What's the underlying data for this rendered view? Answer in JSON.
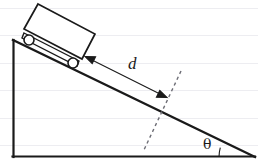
{
  "figure": {
    "kind": "inclined-plane-physics-diagram",
    "background_color": "#ffffff",
    "stroke_color": "#1a1a1a",
    "gridline_color": "#ededf1",
    "width": 258,
    "height": 165
  },
  "labels": {
    "distance": "d",
    "angle": "θ"
  },
  "incline": {
    "apex_top": [
      13,
      40
    ],
    "apex_bottom_left": [
      13,
      157
    ],
    "apex_right": [
      255,
      157
    ],
    "gridlines_y": [
      8,
      35,
      63,
      90,
      118,
      145
    ]
  },
  "cart": {
    "body_corners": [
      [
        38,
        4
      ],
      [
        95,
        34
      ],
      [
        82,
        59
      ],
      [
        24,
        29
      ]
    ],
    "chassis_corners": [
      [
        24,
        36
      ],
      [
        78,
        64
      ]
    ],
    "wheels": [
      {
        "name": "rear-wheel",
        "cx": 29,
        "cy": 40,
        "r": 5
      },
      {
        "name": "front-wheel",
        "cx": 73,
        "cy": 63,
        "r": 5
      }
    ]
  },
  "measurement": {
    "arrow_start": [
      86,
      57
    ],
    "arrow_end": [
      166,
      97
    ],
    "double_headed": true
  },
  "perpendicular": {
    "dashed_start": [
      181,
      72
    ],
    "dashed_end": [
      143,
      152
    ],
    "dash_pattern": "3,3"
  },
  "angle_arc": {
    "vertex": [
      255,
      157
    ],
    "radius": 36,
    "sweep_deg": 14
  }
}
